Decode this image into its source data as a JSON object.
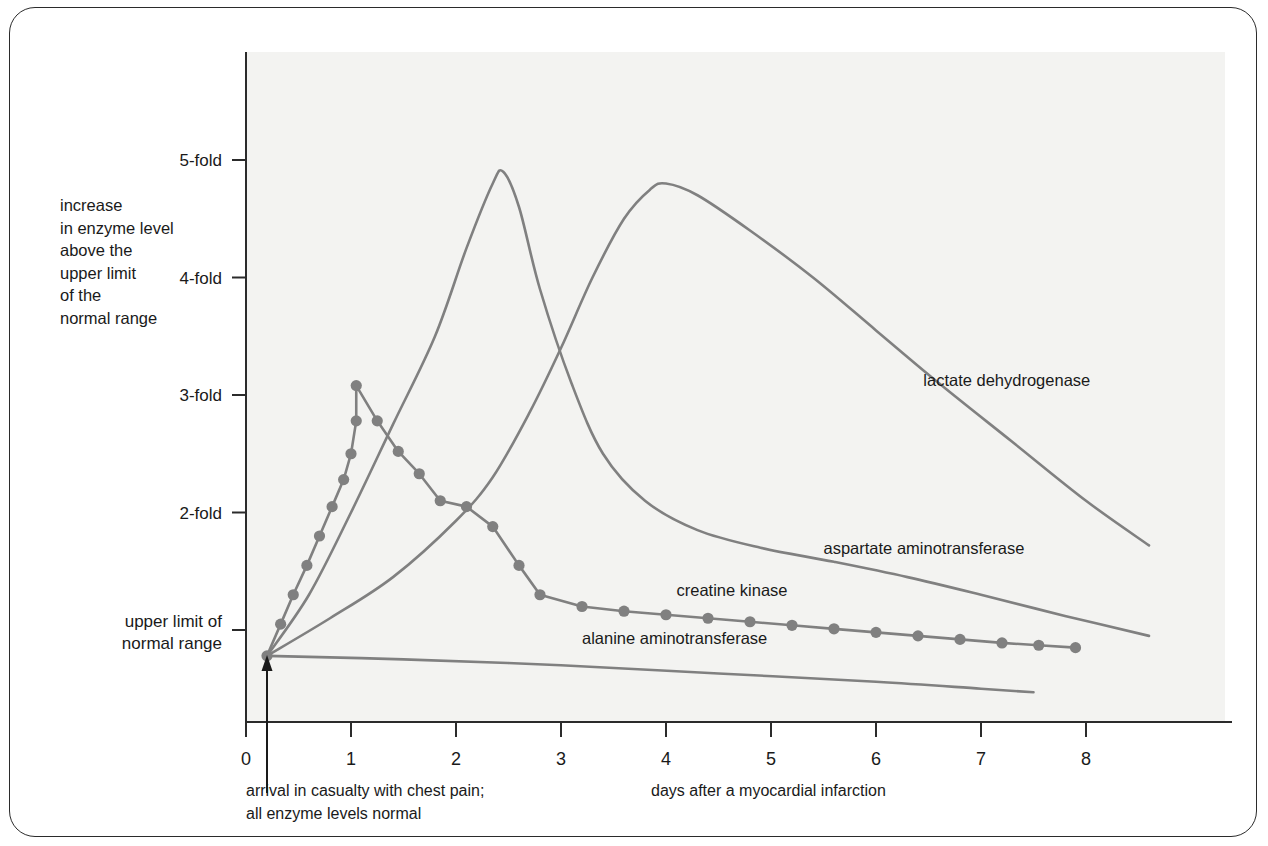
{
  "figure": {
    "background_color": "#ffffff",
    "plot_background_color": "#f3f3f1",
    "border_color": "#2b2b2b",
    "curve_color": "#808080",
    "marker_color": "#808080",
    "axis_color": "#2b2b2b"
  },
  "ylabel": {
    "lines": [
      "increase",
      "in enzyme level",
      "above the",
      "upper limit",
      "of the",
      "normal range"
    ]
  },
  "annotations": {
    "arrival": {
      "line1": "arrival in casualty with chest pain;",
      "line2": "all enzyme levels normal"
    },
    "xaxis_caption": "days after a myocardial infarction"
  },
  "chart_data": {
    "type": "line",
    "title": "",
    "xlabel": "days after a myocardial infarction",
    "ylabel": "increase in enzyme level above the upper limit of the normal range",
    "xlim": [
      -0.05,
      9.3
    ],
    "ylim": [
      0,
      5.65
    ],
    "grid": false,
    "legend": "inline-curve-labels",
    "x_ticks": [
      {
        "value": 0,
        "label": "0"
      },
      {
        "value": 1,
        "label": "1"
      },
      {
        "value": 2,
        "label": "2"
      },
      {
        "value": 3,
        "label": "3"
      },
      {
        "value": 4,
        "label": "4"
      },
      {
        "value": 5,
        "label": "5"
      },
      {
        "value": 6,
        "label": "6"
      },
      {
        "value": 7,
        "label": "7"
      },
      {
        "value": 8,
        "label": "8"
      }
    ],
    "y_ticks": [
      {
        "value": 1,
        "label": "upper limit of\nnormal range",
        "label_line1": "upper limit of",
        "label_line2": "normal range"
      },
      {
        "value": 2,
        "label": "2-fold"
      },
      {
        "value": 3,
        "label": "3-fold"
      },
      {
        "value": 4,
        "label": "4-fold"
      },
      {
        "value": 5,
        "label": "5-fold"
      }
    ],
    "onset_marker": {
      "x": 0.2,
      "label": "arrival in casualty with chest pain; all enzyme levels normal"
    },
    "series": [
      {
        "name": "creatine kinase",
        "label": "creatine kinase",
        "label_x": 4.1,
        "label_y": 1.29,
        "has_markers": true,
        "points": [
          [
            0.2,
            0.78
          ],
          [
            0.33,
            1.05
          ],
          [
            0.45,
            1.3
          ],
          [
            0.58,
            1.55
          ],
          [
            0.7,
            1.8
          ],
          [
            0.82,
            2.05
          ],
          [
            0.93,
            2.28
          ],
          [
            1.0,
            2.5
          ],
          [
            1.05,
            2.78
          ],
          [
            1.05,
            3.08
          ],
          [
            1.25,
            2.78
          ],
          [
            1.45,
            2.52
          ],
          [
            1.65,
            2.33
          ],
          [
            1.85,
            2.1
          ],
          [
            2.1,
            2.05
          ],
          [
            2.35,
            1.88
          ],
          [
            2.6,
            1.55
          ],
          [
            2.8,
            1.3
          ],
          [
            3.2,
            1.2
          ],
          [
            3.6,
            1.16
          ],
          [
            4.0,
            1.13
          ],
          [
            4.4,
            1.1
          ],
          [
            4.8,
            1.07
          ],
          [
            5.2,
            1.04
          ],
          [
            5.6,
            1.01
          ],
          [
            6.0,
            0.98
          ],
          [
            6.4,
            0.95
          ],
          [
            6.8,
            0.92
          ],
          [
            7.2,
            0.89
          ],
          [
            7.55,
            0.87
          ],
          [
            7.9,
            0.85
          ]
        ]
      },
      {
        "name": "aspartate aminotransferase",
        "label": "aspartate aminotransferase",
        "label_x": 5.5,
        "label_y": 1.65,
        "has_markers": false,
        "points": [
          [
            0.2,
            0.78
          ],
          [
            0.6,
            1.3
          ],
          [
            1.0,
            2.0
          ],
          [
            1.4,
            2.75
          ],
          [
            1.8,
            3.5
          ],
          [
            2.1,
            4.25
          ],
          [
            2.35,
            4.8
          ],
          [
            2.45,
            4.9
          ],
          [
            2.6,
            4.6
          ],
          [
            2.8,
            3.9
          ],
          [
            3.1,
            3.1
          ],
          [
            3.4,
            2.5
          ],
          [
            3.8,
            2.1
          ],
          [
            4.3,
            1.85
          ],
          [
            4.9,
            1.7
          ],
          [
            5.6,
            1.58
          ],
          [
            6.3,
            1.45
          ],
          [
            7.0,
            1.3
          ],
          [
            7.8,
            1.12
          ],
          [
            8.6,
            0.95
          ]
        ]
      },
      {
        "name": "lactate dehydrogenase",
        "label": "lactate dehydrogenase",
        "label_x": 6.45,
        "label_y": 3.08,
        "has_markers": false,
        "points": [
          [
            0.2,
            0.78
          ],
          [
            0.8,
            1.1
          ],
          [
            1.4,
            1.45
          ],
          [
            2.0,
            1.93
          ],
          [
            2.35,
            2.3
          ],
          [
            2.7,
            2.85
          ],
          [
            3.0,
            3.4
          ],
          [
            3.3,
            4.0
          ],
          [
            3.6,
            4.5
          ],
          [
            3.85,
            4.75
          ],
          [
            4.0,
            4.8
          ],
          [
            4.3,
            4.7
          ],
          [
            4.8,
            4.4
          ],
          [
            5.4,
            4.0
          ],
          [
            6.0,
            3.55
          ],
          [
            6.6,
            3.1
          ],
          [
            7.3,
            2.6
          ],
          [
            8.0,
            2.1
          ],
          [
            8.6,
            1.72
          ]
        ]
      },
      {
        "name": "alanine aminotransferase",
        "label": "alanine aminotransferase",
        "label_x": 3.2,
        "label_y": 0.88,
        "has_markers": false,
        "points": [
          [
            0.2,
            0.78
          ],
          [
            1.5,
            0.75
          ],
          [
            3.0,
            0.7
          ],
          [
            4.5,
            0.63
          ],
          [
            6.0,
            0.56
          ],
          [
            7.0,
            0.5
          ],
          [
            7.5,
            0.47
          ]
        ]
      }
    ]
  }
}
